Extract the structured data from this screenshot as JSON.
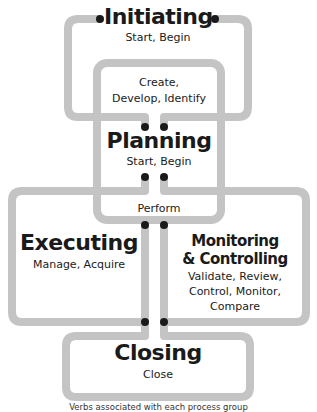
{
  "diagram": {
    "groups": [
      {
        "id": "initiating",
        "title": "Initiating",
        "verbs": "Start, Begin"
      },
      {
        "id": "planning",
        "title": "Planning",
        "verbs": "Start, Begin",
        "inner_verbs": [
          "Create,",
          "Develop, Identify"
        ]
      },
      {
        "id": "executing",
        "title": "Executing",
        "verbs": "Manage, Acquire"
      },
      {
        "id": "monitoring",
        "title_lines": [
          "Monitoring",
          "& Controlling"
        ],
        "verbs_lines": [
          "Validate, Review,",
          "Control, Monitor,",
          "Compare"
        ]
      },
      {
        "id": "closing",
        "title": "Closing",
        "verbs": "Close"
      }
    ],
    "shared_label": "Perform",
    "caption": "Verbs associated with each process group",
    "colors": {
      "line": "#c4c4c4",
      "dot": "#1a1a1a",
      "text": "#1a1a1a"
    }
  }
}
